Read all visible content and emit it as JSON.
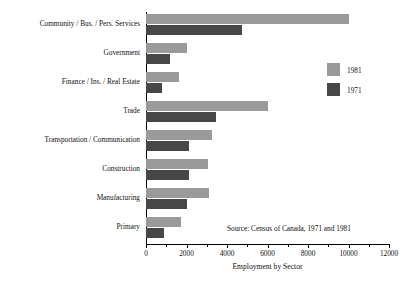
{
  "chart_data": {
    "type": "bar",
    "orientation": "horizontal",
    "title": "",
    "xlabel": "Employment by Sector",
    "ylabel": "",
    "xlim": [
      0,
      12000
    ],
    "xticks": [
      0,
      2000,
      4000,
      6000,
      8000,
      10000,
      12000
    ],
    "grid": false,
    "legend_position": "right",
    "categories": [
      "Community / Bus. / Pers. Services",
      "Government",
      "Finance / Ins. / Real Estate",
      "Trade",
      "Transportation / Communication",
      "Construction",
      "Manufacturing",
      "Primary"
    ],
    "series": [
      {
        "name": "1981",
        "color": "#9a9a9a",
        "values": [
          10000,
          2000,
          1650,
          6000,
          3250,
          3050,
          3100,
          1750
        ]
      },
      {
        "name": "1971",
        "color": "#474747",
        "values": [
          4750,
          1200,
          800,
          3450,
          2100,
          2100,
          2000,
          900
        ]
      }
    ],
    "annotations": [
      "Source:  Census of Canada, 1971 and 1981"
    ]
  },
  "axis": {
    "x_title": "Employment by Sector",
    "tick_labels": [
      "0",
      "2000",
      "4000",
      "6000",
      "8000",
      "10000",
      "12000"
    ]
  },
  "legend": {
    "items": [
      {
        "label": "1981",
        "color": "#9a9a9a"
      },
      {
        "label": "1971",
        "color": "#474747"
      }
    ]
  },
  "source": {
    "text": "Source:  Census of Canada, 1971 and 1981"
  }
}
